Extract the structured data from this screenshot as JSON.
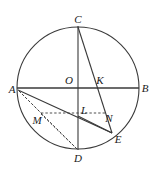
{
  "figure": {
    "canvas": {
      "width": 153,
      "height": 171
    },
    "stroke_color": "#3a3a3a",
    "label_color": "#1a1a1a",
    "background_color": "#ffffff",
    "circle": {
      "cx": 78,
      "cy": 88,
      "r": 61
    },
    "labels": {
      "A": "A",
      "B": "B",
      "C": "C",
      "D": "D",
      "E": "E",
      "K": "K",
      "L": "L",
      "M": "M",
      "N": "N",
      "O": "O"
    },
    "points": {
      "A": {
        "x": 17,
        "y": 88
      },
      "B": {
        "x": 139,
        "y": 88
      },
      "C": {
        "x": 78,
        "y": 26
      },
      "D": {
        "x": 78,
        "y": 150
      },
      "E": {
        "x": 112,
        "y": 133
      },
      "K": {
        "x": 97,
        "y": 88
      },
      "L": {
        "x": 78,
        "y": 116
      },
      "M": {
        "x": 41,
        "y": 113
      },
      "N": {
        "x": 104,
        "y": 116
      },
      "O": {
        "x": 78,
        "y": 88
      }
    },
    "label_positions": {
      "A": {
        "x": 12,
        "y": 89
      },
      "B": {
        "x": 145,
        "y": 88
      },
      "C": {
        "x": 78,
        "y": 19
      },
      "D": {
        "x": 78,
        "y": 158
      },
      "E": {
        "x": 118,
        "y": 139
      },
      "K": {
        "x": 100,
        "y": 80
      },
      "L": {
        "x": 84,
        "y": 110
      },
      "M": {
        "x": 37,
        "y": 120
      },
      "N": {
        "x": 109,
        "y": 118
      },
      "O": {
        "x": 69,
        "y": 80
      }
    },
    "solid_segments": [
      {
        "name": "chord-AB",
        "from": "A",
        "to": "B"
      },
      {
        "name": "chord-CD",
        "from": "C",
        "to": "D"
      },
      {
        "name": "chord-CE",
        "from": "C",
        "to": "E"
      },
      {
        "name": "chord-AE",
        "from": "A",
        "to": "E"
      },
      {
        "name": "segment-LE",
        "from": "L",
        "to": "E"
      }
    ],
    "dashed_segments": [
      {
        "name": "segment-AM",
        "from": "A",
        "to": "M"
      },
      {
        "name": "segment-MN",
        "from": "M",
        "to": "N"
      },
      {
        "name": "segment-MD",
        "from": "M",
        "to": "D"
      },
      {
        "name": "segment-AD-dashed",
        "from": "A",
        "to": "D"
      }
    ]
  }
}
